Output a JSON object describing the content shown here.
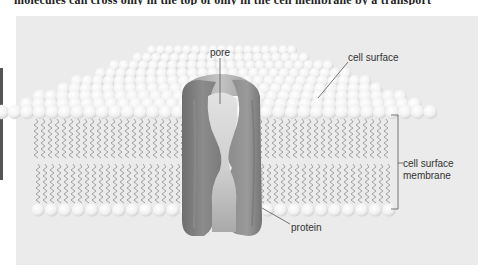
{
  "page": {
    "cut_off_text": "molecules can cross only in the top of only in the cell membrane by a transport"
  },
  "figure": {
    "labels": {
      "pore": "pore",
      "cell_surface": "cell surface",
      "membrane_line1": "cell surface",
      "membrane_line2": "membrane",
      "protein": "protein"
    },
    "colors": {
      "panel_bg": "#ebebeb",
      "phospholipid_head": "#f7f7f7",
      "tail": "#9a9a9a",
      "protein_dark": "#7a7a7a",
      "protein_mid": "#939393",
      "pore_light": "#d8d8d8",
      "leader_line": "#555555"
    }
  }
}
